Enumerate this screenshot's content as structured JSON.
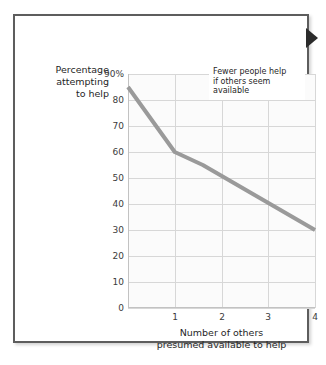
{
  "figure": {
    "edge_marker_icon": "right-triangle-marker"
  },
  "annotation": {
    "lines": [
      "Fewer people help",
      "if others seem",
      "available"
    ]
  },
  "axes": {
    "y_title_lines": [
      "Percentage",
      "attempting",
      "to help"
    ],
    "x_title_lines": [
      "Number of others",
      "presumed available to help"
    ]
  },
  "chart_data": {
    "type": "line",
    "title": "",
    "subtitle": "",
    "xlabel": "Number of others presumed available to help",
    "ylabel": "Percentage attempting to help",
    "x": [
      0,
      1,
      1.6,
      4
    ],
    "values": [
      85,
      60,
      55,
      30
    ],
    "series": [
      {
        "name": "Percentage attempting to help",
        "x": [
          0,
          1,
          1.6,
          4
        ],
        "values": [
          85,
          60,
          55,
          30
        ],
        "color": "#9a9a9a"
      }
    ],
    "xlim": [
      0,
      4
    ],
    "ylim": [
      0,
      90
    ],
    "x_ticks": [
      0,
      1,
      2,
      3,
      4
    ],
    "x_tick_labels": [
      "",
      "1",
      "2",
      "3",
      "4"
    ],
    "y_ticks": [
      0,
      10,
      20,
      30,
      40,
      50,
      60,
      70,
      80,
      90
    ],
    "y_tick_labels": [
      "0",
      "10",
      "20",
      "30",
      "40",
      "50",
      "60",
      "70",
      "80",
      "90%"
    ],
    "grid": true,
    "legend": "none",
    "annotations": [
      {
        "text": "Fewer people help if others seem available",
        "position": "top-right"
      }
    ],
    "line_color": "#9a9a9a",
    "grid_color": "#d7d7d7",
    "plot_bg": "#fbfbfb"
  }
}
